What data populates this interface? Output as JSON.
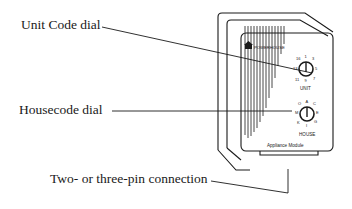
{
  "callouts": {
    "unit_code_dial": "Unit Code dial",
    "housecode_dial": "Housecode dial",
    "pin_connection": "Two- or three-pin connection"
  },
  "device": {
    "brand": "POWERHOUSE",
    "model_label": "Appliance Module",
    "unit_dial": {
      "label": "UNIT",
      "ticks": [
        "16",
        "1",
        "3",
        "13",
        "5",
        "11",
        "9",
        "7"
      ]
    },
    "house_dial": {
      "label": "HOUSE",
      "ticks": [
        "O",
        "A",
        "C",
        "M",
        "E",
        "K",
        "I",
        "G"
      ]
    }
  }
}
